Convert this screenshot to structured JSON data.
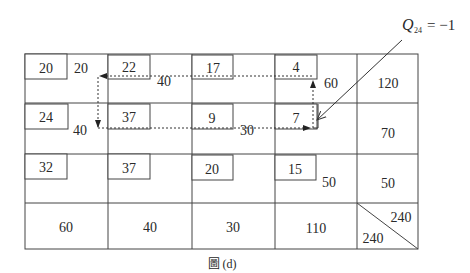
{
  "annotation": {
    "symbol": "Q",
    "subscript": "24",
    "value": "= −1"
  },
  "caption": "圖 (d)",
  "table": {
    "rows": [
      {
        "cells": [
          {
            "cost": "20",
            "allocation": "20"
          },
          {
            "cost": "22",
            "allocation": "40"
          },
          {
            "cost": "17",
            "allocation": ""
          },
          {
            "cost": "4",
            "allocation": "60"
          }
        ],
        "supply": "120"
      },
      {
        "cells": [
          {
            "cost": "24",
            "allocation": "40"
          },
          {
            "cost": "37",
            "allocation": ""
          },
          {
            "cost": "9",
            "allocation": "30"
          },
          {
            "cost": "7",
            "allocation": ""
          }
        ],
        "supply": "70"
      },
      {
        "cells": [
          {
            "cost": "32",
            "allocation": ""
          },
          {
            "cost": "37",
            "allocation": ""
          },
          {
            "cost": "20",
            "allocation": ""
          },
          {
            "cost": "15",
            "allocation": "50"
          }
        ],
        "supply": "50"
      }
    ],
    "demand": [
      "60",
      "40",
      "30",
      "110"
    ],
    "total_supply": "240",
    "total_demand": "240"
  },
  "loop": {
    "description": "closed path starting from cell (2,4)",
    "path": [
      "(2,4)",
      "(1,4)",
      "(1,2)",
      "(2,2)",
      "(2,4)"
    ],
    "style": "dashed"
  }
}
